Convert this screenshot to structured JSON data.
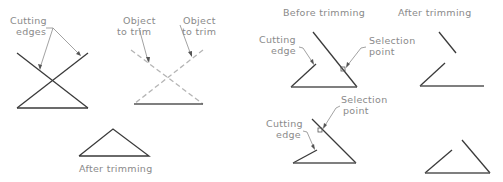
{
  "figure": {
    "left": {
      "cutting_edges_label": [
        "Cutting",
        "edges"
      ],
      "object_to_trim_label_1": [
        "Object",
        "to trim"
      ],
      "object_to_trim_label_2": [
        "Object",
        "to trim"
      ],
      "after_caption": "After trimming"
    },
    "right": {
      "before_caption": "Before trimming",
      "after_caption": "After trimming",
      "top": {
        "cutting_edge_label": [
          "Cutting",
          "edge"
        ],
        "selection_point_label": [
          "Selection",
          "point"
        ]
      },
      "bottom": {
        "cutting_edge_label": [
          "Cutting",
          "edge"
        ],
        "selection_point_label": [
          "Selection",
          "point"
        ]
      }
    }
  }
}
